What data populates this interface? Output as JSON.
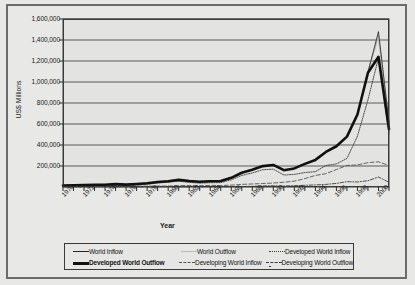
{
  "figure": {
    "background": "#e8e8e6",
    "plot_background": "#e3e3e1",
    "frame_color": "#3a3a3a"
  },
  "axis": {
    "y_title": "US$ Millions",
    "x_title": "Year",
    "y_ticks": [
      "1,600,000",
      "1,400,000",
      "1,200,000",
      "1,000,000",
      "800,000",
      "600,000",
      "400,000",
      "200,000"
    ],
    "x_ticks": [
      "1970",
      "1972",
      "1974",
      "1976",
      "1978",
      "1980",
      "1982",
      "1984",
      "1986",
      "1988",
      "1990",
      "1992",
      "1994",
      "1996",
      "1998",
      "2000"
    ]
  },
  "legend": {
    "items": [
      {
        "label": "World Inflow",
        "style": "thin-solid",
        "color": "#222222",
        "bold": false
      },
      {
        "label": "World Outflow",
        "style": "faint-solid",
        "color": "#b9b9b7",
        "bold": false
      },
      {
        "label": "Developed World Inflow",
        "style": "dotted",
        "color": "#3c3c3c",
        "bold": false
      },
      {
        "label": "Developed World Outflow",
        "style": "thick-solid",
        "color": "#111111",
        "bold": true
      },
      {
        "label": "Developing World Inflow",
        "style": "dashed",
        "color": "#555555",
        "bold": false
      },
      {
        "label": "Developing World Outflow",
        "style": "dash-dot",
        "color": "#3c3c3c",
        "bold": false
      }
    ]
  },
  "chart_data": {
    "type": "line",
    "title": "",
    "xlabel": "Year",
    "ylabel": "US$ Millions",
    "xlim": [
      1970,
      2001
    ],
    "ylim": [
      0,
      1600000
    ],
    "ytick_values": [
      200000,
      400000,
      600000,
      800000,
      1000000,
      1200000,
      1400000,
      1600000
    ],
    "grid": "horizontal",
    "legend_position": "bottom",
    "x": [
      1970,
      1971,
      1972,
      1973,
      1974,
      1975,
      1976,
      1977,
      1978,
      1979,
      1980,
      1981,
      1982,
      1983,
      1984,
      1985,
      1986,
      1987,
      1988,
      1989,
      1990,
      1991,
      1992,
      1993,
      1994,
      1995,
      1996,
      1997,
      1998,
      1999,
      2000,
      2001
    ],
    "series": [
      {
        "name": "World Inflow",
        "style": "thin-solid",
        "color": "#222222",
        "values": [
          13300,
          16000,
          18000,
          21000,
          20000,
          26000,
          22000,
          27000,
          34000,
          47000,
          55000,
          69000,
          58000,
          50000,
          56000,
          56000,
          86000,
          135000,
          163000,
          198000,
          208000,
          159000,
          176000,
          218000,
          256000,
          332000,
          386000,
          478000,
          694000,
          1092000,
          1480000,
          620000
        ]
      },
      {
        "name": "World Outflow",
        "style": "faint-solid",
        "color": "#b9b9b7",
        "values": [
          14000,
          16500,
          18500,
          22000,
          21000,
          27000,
          23000,
          28000,
          36000,
          49000,
          56000,
          70000,
          59000,
          51000,
          57000,
          58000,
          88000,
          138000,
          166000,
          200000,
          212000,
          162000,
          178000,
          222000,
          260000,
          337000,
          390000,
          482000,
          700000,
          1100000,
          1440000,
          590000
        ]
      },
      {
        "name": "Developed World Inflow",
        "style": "dotted",
        "color": "#3c3c3c",
        "values": [
          9500,
          11500,
          13000,
          15000,
          14000,
          18000,
          15000,
          19000,
          26000,
          38000,
          46000,
          56000,
          44000,
          37000,
          41000,
          42000,
          68000,
          110000,
          134000,
          165000,
          170000,
          114000,
          120000,
          138000,
          146000,
          205000,
          220000,
          272000,
          484000,
          830000,
          1230000,
          510000
        ]
      },
      {
        "name": "Developed World Outflow",
        "style": "thick-solid",
        "color": "#111111",
        "values": [
          14000,
          16000,
          18000,
          22000,
          21000,
          27000,
          23000,
          28000,
          35000,
          48000,
          55000,
          68000,
          57000,
          50000,
          55000,
          57000,
          87000,
          136000,
          164000,
          199000,
          210000,
          160000,
          177000,
          220000,
          258000,
          334000,
          388000,
          480000,
          690000,
          1088000,
          1240000,
          550000
        ]
      },
      {
        "name": "Developing World Inflow",
        "style": "dashed",
        "color": "#555555",
        "values": [
          3800,
          4500,
          5000,
          6000,
          6000,
          8000,
          7000,
          8000,
          8000,
          9000,
          9000,
          13000,
          14000,
          13000,
          15000,
          14000,
          18000,
          25000,
          29000,
          33000,
          38000,
          45000,
          56000,
          80000,
          110000,
          127000,
          166000,
          206000,
          210000,
          232000,
          240000,
          205000
        ]
      },
      {
        "name": "Developing World Outflow",
        "style": "dash-dot",
        "color": "#3c3c3c",
        "values": [
          400,
          500,
          600,
          700,
          800,
          1000,
          900,
          1000,
          1200,
          1400,
          3000,
          1800,
          2000,
          1600,
          1800,
          2000,
          2500,
          4000,
          6000,
          10000,
          12000,
          9000,
          13000,
          16000,
          20000,
          25000,
          34000,
          51000,
          48000,
          60000,
          95000,
          45000
        ]
      }
    ]
  }
}
